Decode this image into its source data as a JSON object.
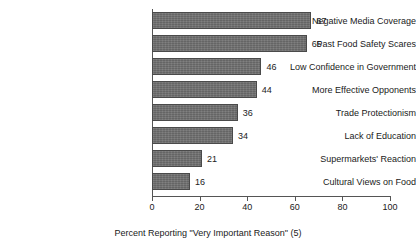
{
  "chart_data": {
    "type": "bar",
    "orientation": "horizontal",
    "title": "",
    "xlabel": "Percent Reporting \"Very Important Reason\" (5)",
    "ylabel": "",
    "categories": [
      "Negative Media Coverage",
      "Past Food Safety Scares",
      "Low Confidence in Government",
      "More Effective Opponents",
      "Trade Protectionism",
      "Lack of Education",
      "Supermarkets' Reaction",
      "Cultural Views on Food"
    ],
    "values": [
      67,
      65,
      46,
      44,
      36,
      34,
      21,
      16
    ],
    "data_labels": [
      "67",
      "65",
      "46",
      "44",
      "36",
      "34",
      "21",
      "16"
    ],
    "xlim": [
      0,
      100
    ],
    "xticks": [
      0,
      20,
      40,
      60,
      80,
      100
    ],
    "xtick_labels": [
      "0",
      "20",
      "40",
      "60",
      "80",
      "100"
    ],
    "grid": false,
    "legend": false,
    "bar_color": "#6e6e6e",
    "bar_border_color": "#4a4a4a",
    "axis_color": "#555555",
    "background": "#ffffff"
  }
}
